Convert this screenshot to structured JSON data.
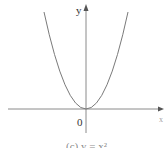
{
  "figure": {
    "caption": "(c) y = x²",
    "y_axis_label": "y",
    "x_axis_label": "x",
    "origin_label": "0",
    "function": "y = x^2",
    "colors": {
      "curve": "#7a7a7a",
      "axes": "#8a8a8a",
      "text": "#333333",
      "background": "#ffffff"
    }
  }
}
